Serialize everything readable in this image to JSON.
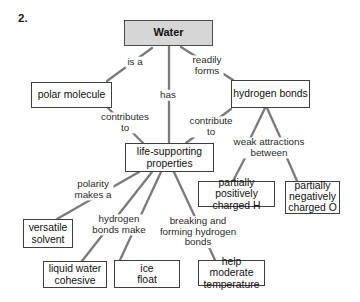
{
  "figure": {
    "number_label": "2."
  },
  "colors": {
    "background": "#ffffff",
    "connector_line": "#7b7b7b",
    "box_border": "#3f3f3f",
    "box_fill": "#ffffff",
    "root_box_fill": "#d6d6d6",
    "text": "#111111"
  },
  "concept_map": {
    "nodes": {
      "water": "Water",
      "polar_molecule": "polar molecule",
      "hydrogen_bonds": "hydrogen bonds",
      "life_supporting_properties": "life-supporting\nproperties",
      "partially_positive": "partially positively\ncharged H",
      "partially_negative": "partially\nnegatively\ncharged O",
      "versatile_solvent": "versatile\nsolvent",
      "liquid_water_cohesive": "liquid water\ncohesive",
      "ice_float": "ice\nfloat",
      "help_moderate_temperature": "help moderate\ntemperature"
    },
    "edge_labels": {
      "is_a": "is a",
      "has": "has",
      "readily_forms": "readily\nforms",
      "contributes_to": "contributes\nto",
      "contribute_to": "contribute\nto",
      "weak_attractions_between": "weak attractions\nbetween",
      "polarity_makes_a": "polarity\nmakes a",
      "hydrogen_bonds_make": "hydrogen\nbonds make",
      "breaking_and_forming": "breaking and\nforming hydrogen\nbonds"
    }
  }
}
